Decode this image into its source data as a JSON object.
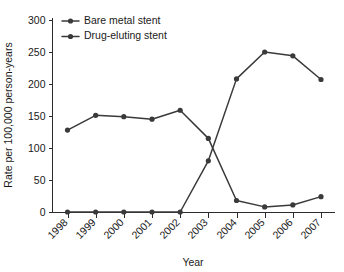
{
  "chart_data": {
    "type": "line",
    "title": "",
    "xlabel": "Year",
    "ylabel": "Rate per 100,000 person-years",
    "categories": [
      "1998",
      "1999",
      "2000",
      "2001",
      "2002",
      "2003",
      "2004",
      "2005",
      "2006",
      "2007"
    ],
    "series": [
      {
        "name": "Bare metal stent",
        "values": [
          128,
          151,
          149,
          145,
          159,
          115,
          18,
          8,
          11,
          24
        ],
        "color": "#3a3a3a",
        "marker": "circle"
      },
      {
        "name": "Drug-eluting stent",
        "values": [
          0,
          0,
          0,
          0,
          0,
          80,
          208,
          250,
          244,
          207
        ],
        "color": "#3a3a3a",
        "marker": "circle"
      }
    ],
    "ylim": [
      0,
      300
    ],
    "yticks": [
      0,
      50,
      100,
      150,
      200,
      250,
      300
    ],
    "ytick_labels": [
      "0",
      "50",
      "100",
      "150",
      "200",
      "250",
      "300"
    ],
    "grid": false,
    "legend_position": "top-left",
    "xtick_rotation": -45,
    "spines": [
      "left",
      "bottom"
    ]
  },
  "legend": {
    "entries": [
      {
        "label": "Bare metal stent"
      },
      {
        "label": "Drug-eluting stent"
      }
    ]
  },
  "axes": {
    "y_title": "Rate per 100,000 person-years",
    "x_title": "Year"
  }
}
